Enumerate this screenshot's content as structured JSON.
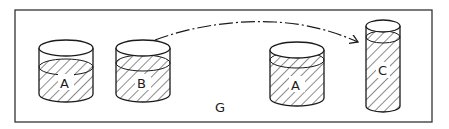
{
  "diagram": {
    "frame_label": "G",
    "colors": {
      "ink": "#1a1a1a",
      "background": "#ffffff"
    },
    "containers": [
      {
        "id": "A1",
        "label": "A",
        "shape": "wide-cylinder",
        "fill": "hatched"
      },
      {
        "id": "B",
        "label": "B",
        "shape": "wide-cylinder",
        "fill": "hatched"
      },
      {
        "id": "A2",
        "label": "A",
        "shape": "wide-cylinder",
        "fill": "hatched"
      },
      {
        "id": "C",
        "label": "C",
        "shape": "tall-narrow-cylinder",
        "fill": "hatched"
      }
    ],
    "arrow": {
      "from": "B",
      "to": "C",
      "style": "dash-dot curved"
    }
  }
}
